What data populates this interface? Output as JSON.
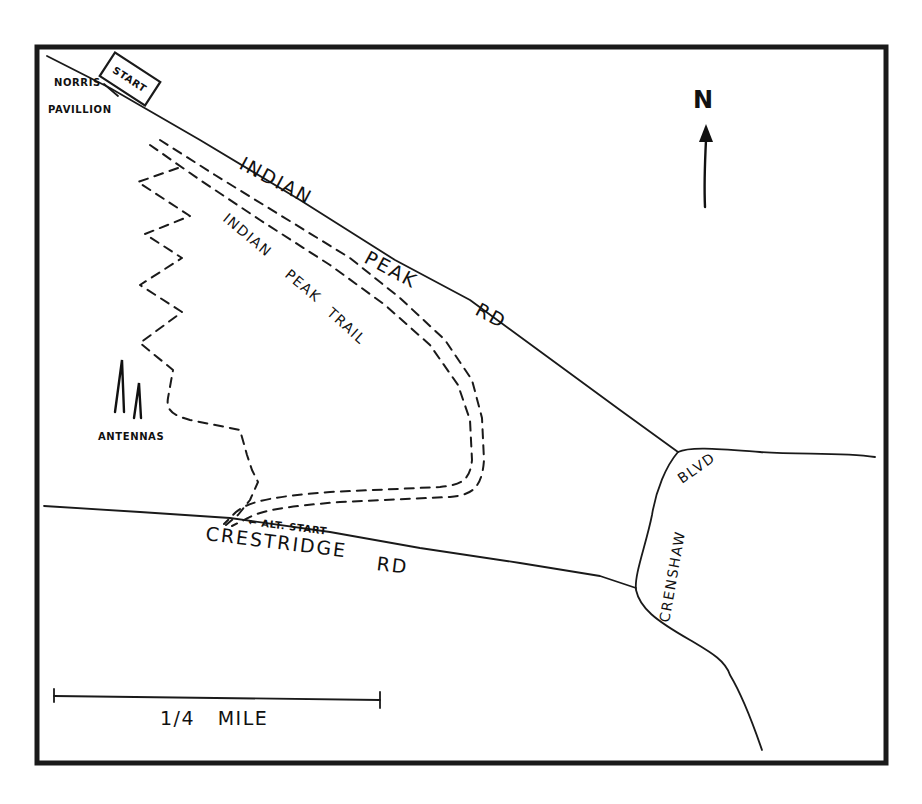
{
  "map": {
    "type": "hand-drawn trail map",
    "colors": {
      "ink": "#1a1a1a",
      "paper": "#ffffff"
    },
    "north_arrow": {
      "label": "N"
    },
    "roads": {
      "indian_peak_rd": {
        "words": [
          "INDIAN",
          "PEAK",
          "RD"
        ]
      },
      "crestridge_rd": {
        "words": [
          "CRESTRIDGE",
          "RD"
        ]
      },
      "crenshaw_blvd": {
        "words": [
          "CRENSHAW",
          "BLVD"
        ]
      }
    },
    "trails": {
      "indian_peak_trail": {
        "words": [
          "INDIAN",
          "PEAK",
          "TRAIL"
        ]
      }
    },
    "landmarks": {
      "norris_pavilion": {
        "line1": "NORRIS",
        "line2": "PAVILLION"
      },
      "start": {
        "label": "START"
      },
      "alt_start": {
        "label": "← ALT. START"
      },
      "antennas": {
        "label": "ANTENNAS"
      }
    },
    "scale_bar": {
      "label": "1/4   MILE"
    }
  }
}
